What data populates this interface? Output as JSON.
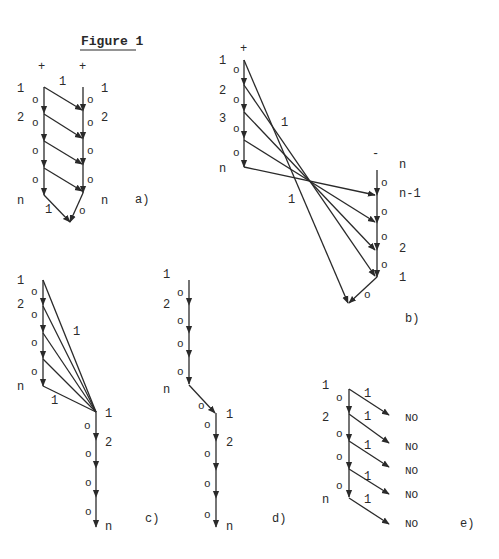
{
  "figure": {
    "title": "Figure 1"
  },
  "panels": {
    "a": {
      "label": "a)",
      "left_polarity": "+",
      "right_polarity": "+",
      "top_weight": "1",
      "left_labels": [
        "1",
        "2",
        "n"
      ],
      "right_labels": [
        "1",
        "2",
        "n"
      ],
      "zero_marks_left": [
        "o",
        "o",
        "o",
        "o"
      ],
      "zero_marks_right": [
        "o",
        "o",
        "o",
        "o"
      ],
      "bottom_left_weight": "1",
      "bottom_right_weight": "o"
    },
    "b": {
      "label": "b)",
      "left_polarity": "+",
      "right_polarity": "-",
      "left_labels": [
        "1",
        "2",
        "3",
        "n"
      ],
      "right_labels": [
        "n",
        "n-1",
        "2",
        "1"
      ],
      "zero_marks_left": [
        "o",
        "o",
        "o",
        "o"
      ],
      "zero_marks_right": [
        "o",
        "o",
        "o",
        "o"
      ],
      "upper_weight": "1",
      "lower_weight": "1",
      "bottom_weight": "o"
    },
    "c": {
      "label": "c)",
      "left_labels": [
        "1",
        "2",
        "n"
      ],
      "zero_marks_left": [
        "o",
        "o",
        "o",
        "o",
        "o"
      ],
      "fan_weight": "1",
      "bottom_weight": "1",
      "right_labels": [
        "1",
        "2",
        "n"
      ],
      "zero_marks_right": [
        "o",
        "o",
        "o",
        "o"
      ]
    },
    "d": {
      "label": "d)",
      "left_labels": [
        "1",
        "2",
        "n"
      ],
      "zero_marks_left": [
        "o",
        "o",
        "o",
        "o"
      ],
      "diag_weight": "o",
      "right_labels": [
        "1",
        "2",
        "n"
      ],
      "zero_marks_right": [
        "o",
        "o",
        "o",
        "o"
      ]
    },
    "e": {
      "label": "e)",
      "left_labels": [
        "1",
        "2",
        "n"
      ],
      "zero_marks_left": [
        "o",
        "o",
        "o",
        "o"
      ],
      "branch_weights": [
        "1",
        "1",
        "1",
        "1",
        "1"
      ],
      "outputs": [
        "NO",
        "NO",
        "NO",
        "NO",
        "NO"
      ]
    }
  }
}
